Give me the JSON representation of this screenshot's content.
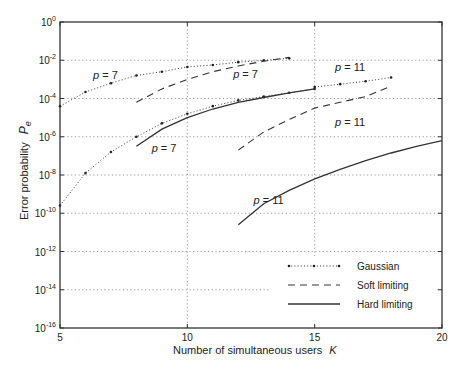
{
  "chart_data": {
    "type": "line",
    "title": "",
    "xlabel": "Number of simultaneous users",
    "xlabel_symbol": "K",
    "ylabel": "Error probability",
    "ylabel_symbol": "P",
    "ylabel_subscript": "e",
    "xlim": [
      5,
      20
    ],
    "ylim_log10": [
      -16,
      0
    ],
    "yscale": "log",
    "grid": true,
    "x_ticks": [
      5,
      10,
      15,
      20
    ],
    "y_ticks_log10": [
      0,
      -2,
      -4,
      -6,
      -8,
      -10,
      -12,
      -14,
      -16
    ],
    "y_tick_labels": [
      "10^0",
      "10^-2",
      "10^-4",
      "10^-6",
      "10^-8",
      "10^-10",
      "10^-12",
      "10^-14",
      "10^-16"
    ],
    "legend": {
      "position": "lower right",
      "entries": [
        {
          "label": "Gaussian",
          "style": "dotted-markers"
        },
        {
          "label": "Soft limiting",
          "style": "dashed"
        },
        {
          "label": "Hard limiting",
          "style": "solid"
        }
      ]
    },
    "series": [
      {
        "name": "Gaussian p = 7 (upper)",
        "style": "dotted-markers",
        "x": [
          5,
          6,
          7,
          8,
          9,
          10,
          11,
          12,
          13,
          14
        ],
        "log10_y": [
          -4.4,
          -3.66,
          -3.2,
          -2.8,
          -2.6,
          -2.35,
          -2.25,
          -2.1,
          -2.0,
          -1.9
        ]
      },
      {
        "name": "Soft limiting p = 7 (upper)",
        "style": "dashed",
        "x": [
          8,
          9,
          10,
          11,
          12,
          13,
          14
        ],
        "log10_y": [
          -4.2,
          -3.5,
          -3.0,
          -2.6,
          -2.3,
          -2.05,
          -1.85
        ]
      },
      {
        "name": "Gaussian p = 7 (lower)",
        "style": "dotted-markers",
        "x": [
          5,
          6,
          7,
          8,
          9,
          10,
          11,
          12,
          13,
          14,
          15
        ],
        "log10_y": [
          -9.6,
          -7.9,
          -6.8,
          -6.0,
          -5.3,
          -4.8,
          -4.4,
          -4.1,
          -3.9,
          -3.7,
          -3.5
        ]
      },
      {
        "name": "Hard limiting p = 7",
        "style": "solid",
        "x": [
          8,
          9,
          10,
          11,
          12,
          13,
          14,
          15
        ],
        "log10_y": [
          -6.5,
          -5.6,
          -5.0,
          -4.55,
          -4.2,
          -3.95,
          -3.7,
          -3.5
        ]
      },
      {
        "name": "Gaussian p = 11",
        "style": "dotted-markers",
        "x": [
          15,
          16,
          17,
          18
        ],
        "log10_y": [
          -3.4,
          -3.25,
          -3.1,
          -2.9
        ]
      },
      {
        "name": "Soft limiting p = 11",
        "style": "dashed",
        "x": [
          12,
          13,
          14,
          15,
          16,
          17,
          18
        ],
        "log10_y": [
          -6.7,
          -5.75,
          -5.1,
          -4.5,
          -4.2,
          -3.9,
          -3.35
        ]
      },
      {
        "name": "Hard limiting p = 11",
        "style": "solid",
        "x": [
          12,
          13,
          14,
          15,
          16,
          17,
          18,
          19,
          20
        ],
        "log10_y": [
          -10.6,
          -9.5,
          -8.8,
          -8.2,
          -7.7,
          -7.25,
          -6.85,
          -6.5,
          -6.2
        ]
      }
    ],
    "annotations": [
      {
        "text": "p = 7",
        "x": 6.3,
        "log10_y": -3.0
      },
      {
        "text": "p = 7",
        "x": 11.8,
        "log10_y": -2.95
      },
      {
        "text": "p = 7",
        "x": 8.6,
        "log10_y": -6.8
      },
      {
        "text": "p = 11",
        "x": 15.8,
        "log10_y": -2.55
      },
      {
        "text": "p = 11",
        "x": 15.8,
        "log10_y": -5.45
      },
      {
        "text": "p = 11",
        "x": 12.6,
        "log10_y": -9.5
      }
    ]
  }
}
